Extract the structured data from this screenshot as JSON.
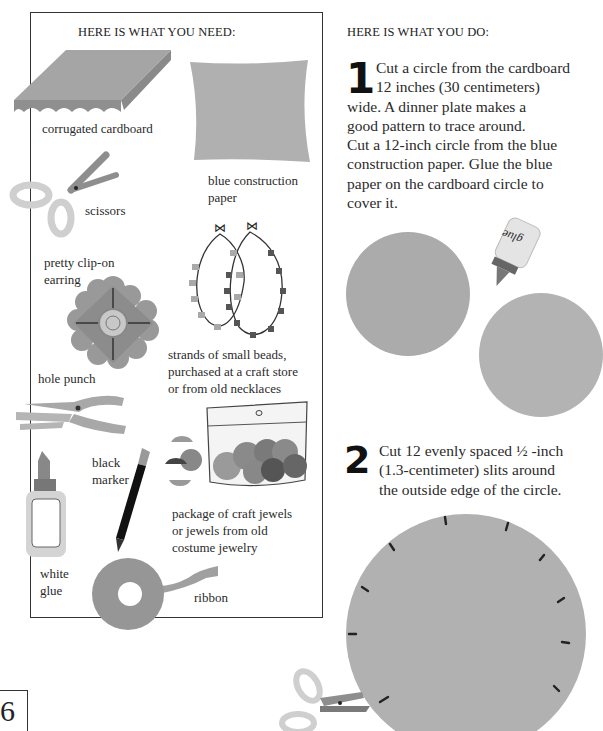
{
  "needs": {
    "heading": "HERE IS WHAT YOU NEED:",
    "items": [
      {
        "label": "corrugated cardboard",
        "icon": "cardboard-icon"
      },
      {
        "label": "blue construction paper",
        "lines": [
          "blue construction",
          "paper"
        ],
        "icon": "paper-icon"
      },
      {
        "label": "scissors",
        "icon": "scissors-icon"
      },
      {
        "label": "pretty clip-on earring",
        "lines": [
          "pretty clip-on",
          "earring"
        ],
        "icon": "earring-icon"
      },
      {
        "label": "strands of small beads, purchased at a craft store or from old necklaces",
        "lines": [
          "strands of small beads,",
          "purchased at a craft store",
          "or from old necklaces"
        ],
        "icon": "beads-icon"
      },
      {
        "label": "hole punch",
        "icon": "hole-punch-icon"
      },
      {
        "label": "black marker",
        "lines": [
          "black",
          "marker"
        ],
        "icon": "marker-icon"
      },
      {
        "label": "package of craft jewels or jewels from old costume jewelry",
        "lines": [
          "package of craft jewels",
          "or jewels from old",
          "costume jewelry"
        ],
        "icon": "jewels-icon"
      },
      {
        "label": "white glue",
        "lines": [
          "white",
          "glue"
        ],
        "icon": "glue-icon"
      },
      {
        "label": "ribbon",
        "icon": "ribbon-icon"
      }
    ]
  },
  "steps": {
    "heading": "HERE IS WHAT YOU DO:",
    "items": [
      {
        "number": "1",
        "lines": [
          "Cut a circle from the cardboard",
          "12 inches (30 centimeters)",
          "wide. A dinner plate makes a",
          "good pattern to trace around.",
          "Cut a 12-inch circle from the blue",
          "construction paper. Glue the blue",
          "paper on the cardboard circle to",
          "cover it."
        ],
        "glue_label": "glue"
      },
      {
        "number": "2",
        "lines": [
          "Cut 12 evenly spaced ½ -inch",
          "(1.3-centimeter) slits around",
          "the outside edge of the circle."
        ],
        "slit_count": 12
      }
    ]
  },
  "page_number": "6",
  "colors": {
    "cardboard": "#a8a8a8",
    "paper": "#b3b3b3",
    "circle": "#b0b0b0",
    "frame": "#333333"
  }
}
